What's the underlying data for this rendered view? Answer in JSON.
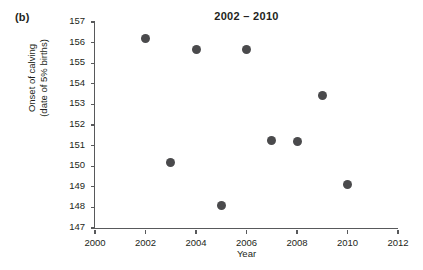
{
  "panel": {
    "label": "(b)"
  },
  "chart_data": {
    "type": "scatter",
    "title": "2002 – 2010",
    "xlabel": "Year",
    "ylabel_line1": "Onset of calving",
    "ylabel_line2": "(date of 5% births)",
    "ylabel": "Onset of calving (date of 5% births)",
    "x": [
      2002,
      2003,
      2004,
      2005,
      2006,
      2007,
      2008,
      2009,
      2010
    ],
    "values": [
      156.2,
      150.2,
      155.65,
      148.1,
      155.65,
      151.25,
      151.2,
      153.45,
      149.1
    ],
    "points": [
      {
        "x": 2002,
        "y": 156.2
      },
      {
        "x": 2003,
        "y": 150.2
      },
      {
        "x": 2004,
        "y": 155.65
      },
      {
        "x": 2005,
        "y": 148.1
      },
      {
        "x": 2006,
        "y": 155.65
      },
      {
        "x": 2007,
        "y": 151.25
      },
      {
        "x": 2008,
        "y": 151.2
      },
      {
        "x": 2009,
        "y": 153.45
      },
      {
        "x": 2010,
        "y": 149.1
      }
    ],
    "xlim": [
      2000,
      2012
    ],
    "ylim": [
      147,
      157
    ],
    "xticks": [
      2000,
      2002,
      2004,
      2006,
      2008,
      2010,
      2012
    ],
    "yticks": [
      147,
      148,
      149,
      150,
      151,
      152,
      153,
      154,
      155,
      156,
      157
    ],
    "grid": false,
    "legend": null,
    "marker_color": "#4a4a4c",
    "axis_color": "#58595b"
  }
}
